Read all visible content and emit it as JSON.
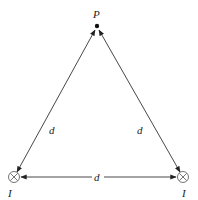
{
  "diagram": {
    "point": {
      "label": "P"
    },
    "currents": [
      {
        "label": "I",
        "symbol": "into-page"
      },
      {
        "label": "I",
        "symbol": "into-page"
      }
    ],
    "distances": {
      "left_side": "d",
      "right_side": "d",
      "bottom_side": "d"
    },
    "colors": {
      "line": "#333333",
      "background": "#ffffff"
    }
  }
}
